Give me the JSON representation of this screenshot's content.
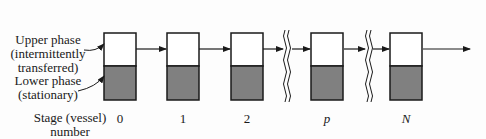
{
  "labels": {
    "upper_phase": [
      "Upper phase",
      "(intermittently",
      "transferred)"
    ],
    "lower_phase": [
      "Lower phase",
      "(stationary)"
    ],
    "stage": [
      "Stage (vessel)",
      "number"
    ]
  },
  "stages": [
    {
      "label": "0",
      "x": 104,
      "italic": false
    },
    {
      "label": "1",
      "x": 167,
      "italic": false
    },
    {
      "label": "2",
      "x": 231,
      "italic": false
    },
    {
      "label": "p",
      "x": 311,
      "italic": true
    },
    {
      "label": "N",
      "x": 390,
      "italic": true
    }
  ],
  "colors": {
    "upper_fill": "#ffffff",
    "lower_fill": "#808080",
    "stroke": "#1a1a1a"
  }
}
